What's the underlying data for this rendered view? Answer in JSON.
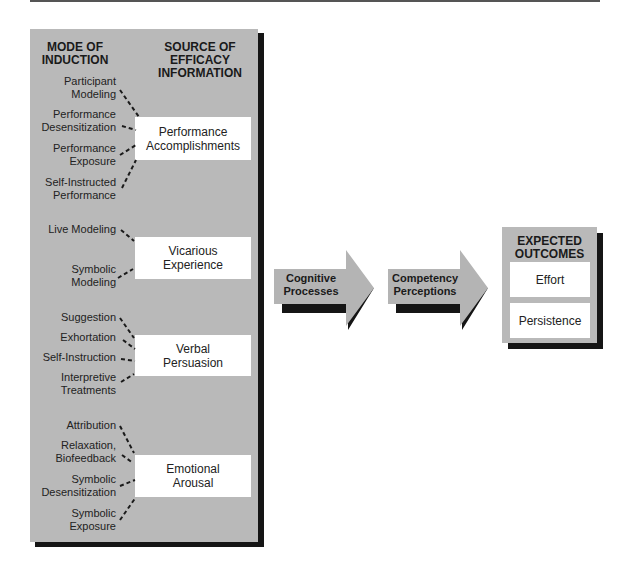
{
  "headers": {
    "mode_of_induction": [
      "MODE OF",
      "INDUCTION"
    ],
    "source_of_efficacy": [
      "SOURCE OF",
      "EFFICACY",
      "INFORMATION"
    ]
  },
  "groups": [
    {
      "source": [
        "Performance",
        "Accomplishments"
      ],
      "modes": [
        [
          "Participant",
          "Modeling"
        ],
        [
          "Performance",
          "Desensitization"
        ],
        [
          "Performance",
          "Exposure"
        ],
        [
          "Self-Instructed",
          "Performance"
        ]
      ]
    },
    {
      "source": [
        "Vicarious",
        "Experience"
      ],
      "modes": [
        [
          "Live Modeling"
        ],
        [
          "Symbolic",
          "Modeling"
        ]
      ]
    },
    {
      "source": [
        "Verbal",
        "Persuasion"
      ],
      "modes": [
        [
          "Suggestion"
        ],
        [
          "Exhortation"
        ],
        [
          "Self-Instruction"
        ],
        [
          "Interpretive",
          "Treatments"
        ]
      ]
    },
    {
      "source": [
        "Emotional",
        "Arousal"
      ],
      "modes": [
        [
          "Attribution"
        ],
        [
          "Relaxation,",
          "Biofeedback"
        ],
        [
          "Symbolic",
          "Desensitization"
        ],
        [
          "Symbolic",
          "Exposure"
        ]
      ]
    }
  ],
  "arrows": [
    {
      "label": [
        "Cognitive",
        "Processes"
      ]
    },
    {
      "label": [
        "Competency",
        "Perceptions"
      ]
    }
  ],
  "outcomes": {
    "title": [
      "EXPECTED",
      "OUTCOMES"
    ],
    "items": [
      "Effort",
      "Persistence"
    ]
  },
  "colors": {
    "panel": "#b9b9b9",
    "shadow": "#151515",
    "box": "#ffffff",
    "arrow": "#b4b4b4"
  }
}
